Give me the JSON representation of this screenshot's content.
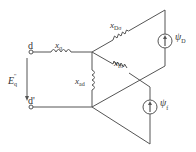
{
  "diagram": {
    "type": "equivalent-circuit",
    "terminals": {
      "top": "d",
      "bottom": "d'"
    },
    "voltage": {
      "symbol": "E",
      "subscript": "q",
      "superscript": "''"
    },
    "components": {
      "x_sigma": {
        "symbol": "x",
        "subscript": "σ"
      },
      "x_ad": {
        "symbol": "x",
        "subscript": "ad"
      },
      "x_D_sigma": {
        "symbol": "x",
        "subscript": "Dσ"
      },
      "x_f_sigma": {
        "symbol": "x",
        "subscript": "fσ"
      },
      "psi_D": {
        "symbol": "ψ",
        "subscript": "D"
      },
      "psi_f": {
        "symbol": "ψ",
        "subscript": "f"
      }
    },
    "stroke_color": "#555555"
  }
}
